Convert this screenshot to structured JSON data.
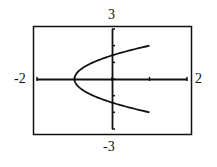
{
  "chart_data": {
    "type": "line",
    "title": "",
    "xlabel": "",
    "ylabel": "",
    "xlim": [
      -2,
      2
    ],
    "ylim": [
      -3,
      3
    ],
    "grid": false,
    "tick_labels": {
      "xmin": "-2",
      "xmax": "2",
      "ymin": "-3",
      "ymax": "3"
    },
    "x_ticks": [
      -2,
      -1,
      0,
      1,
      2
    ],
    "y_ticks": [
      -3,
      -2,
      -1,
      0,
      1,
      2,
      3
    ],
    "series": [
      {
        "name": "sideways parabola (x = y^2/2 - 1)",
        "points": [
          [
            1.0,
            2.0
          ],
          [
            0.5,
            1.732
          ],
          [
            0.0,
            1.414
          ],
          [
            -0.5,
            1.0
          ],
          [
            -0.875,
            0.5
          ],
          [
            -1.0,
            0.0
          ],
          [
            -0.875,
            -0.5
          ],
          [
            -0.5,
            -1.0
          ],
          [
            0.0,
            -1.414
          ],
          [
            0.5,
            -1.732
          ],
          [
            1.0,
            -2.0
          ]
        ]
      }
    ]
  },
  "labels": {
    "top": "3",
    "bottom": "-3",
    "left": "-2",
    "right": "2"
  }
}
